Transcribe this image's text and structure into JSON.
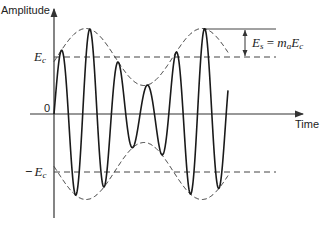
{
  "diagram": {
    "labels": {
      "y_axis": "Amplitude",
      "x_axis": "Time",
      "origin": "0",
      "carrier_pos": "E",
      "carrier_pos_sub": "c",
      "carrier_neg_prefix": "−",
      "carrier_neg": "E",
      "carrier_neg_sub": "c",
      "sideband_eq": {
        "lhs": "E",
        "lhs_sub": "s",
        "eq": " = ",
        "m": "m",
        "m_sub": "a",
        "rhs": "E",
        "rhs_sub": "c"
      }
    },
    "colors": {
      "stroke": "#1a1a1a",
      "axis": "#333333",
      "dashed": "#444444",
      "background": "#ffffff"
    },
    "geometry": {
      "origin_x": 54,
      "zero_y": 114,
      "carrier_amplitude_px": 57,
      "modulation_index": 0.5,
      "envelope_peak_x": 86,
      "envelope_period_px": 116,
      "carrier_period_px": 28.7,
      "wave_start_x": 54,
      "wave_end_x": 228,
      "envelope_end_x": 228
    }
  }
}
